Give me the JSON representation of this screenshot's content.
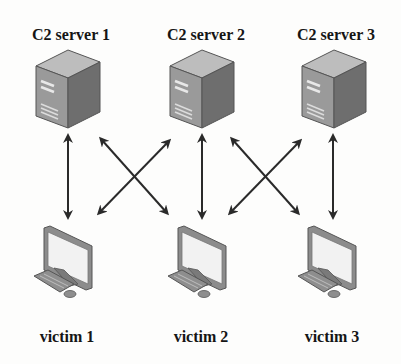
{
  "diagram": {
    "type": "network-topology",
    "servers": [
      {
        "id": "s1",
        "label": "C2 server 1",
        "icon": "server-tower-icon"
      },
      {
        "id": "s2",
        "label": "C2 server 2",
        "icon": "server-tower-icon"
      },
      {
        "id": "s3",
        "label": "C2 server 3",
        "icon": "server-tower-icon"
      }
    ],
    "victims": [
      {
        "id": "v1",
        "label": "victim 1",
        "icon": "desktop-computer-icon"
      },
      {
        "id": "v2",
        "label": "victim 2",
        "icon": "desktop-computer-icon"
      },
      {
        "id": "v3",
        "label": "victim 3",
        "icon": "desktop-computer-icon"
      }
    ],
    "edges": [
      {
        "from": "s1",
        "to": "v1",
        "style": "bidirectional-arrow"
      },
      {
        "from": "s1",
        "to": "v2",
        "style": "bidirectional-arrow"
      },
      {
        "from": "s2",
        "to": "v1",
        "style": "bidirectional-arrow"
      },
      {
        "from": "s2",
        "to": "v2",
        "style": "bidirectional-arrow"
      },
      {
        "from": "s2",
        "to": "v3",
        "style": "bidirectional-arrow"
      },
      {
        "from": "s3",
        "to": "v2",
        "style": "bidirectional-arrow"
      },
      {
        "from": "s3",
        "to": "v3",
        "style": "bidirectional-arrow"
      }
    ],
    "colors": {
      "text": "#151515",
      "arrow": "#2a2a2a",
      "server_front": "#9a9a9a",
      "server_side": "#6e6e6e",
      "server_top": "#bdbdbd",
      "monitor_frame": "#8c8c8c",
      "monitor_screen": "#f2f2f2"
    }
  }
}
